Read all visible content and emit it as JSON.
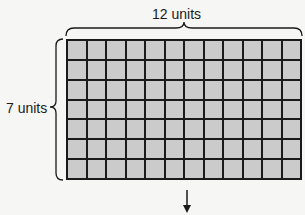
{
  "diagram": {
    "top_label": "12 units",
    "side_label": "7 units",
    "columns": 12,
    "rows": 7,
    "cell_color": "#cbcbcb",
    "line_color": "#1a1a1a",
    "arrow": "down-arrow"
  }
}
